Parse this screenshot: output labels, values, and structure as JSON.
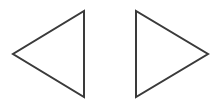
{
  "canvas": {
    "width": 220,
    "height": 105,
    "background_color": "#ffffff",
    "description": "Two outlined triangles side by side on a white background"
  },
  "style": {
    "stroke_color": "#3a3a3a",
    "stroke_width": 2,
    "fill": "none"
  },
  "shapes": [
    {
      "name": "left-pointing-triangle",
      "label": "Left-pointing triangle",
      "direction": "left",
      "points": "84,11 84,97 13,54",
      "vertices": [
        {
          "x": 84,
          "y": 11
        },
        {
          "x": 84,
          "y": 97
        },
        {
          "x": 13,
          "y": 54
        }
      ],
      "apex": {
        "x": 13,
        "y": 54
      },
      "stroke_color": "#3a3a3a",
      "stroke_width": 2
    },
    {
      "name": "right-pointing-triangle",
      "label": "Right-pointing triangle",
      "direction": "right",
      "points": "136,11 136,97 208,54",
      "vertices": [
        {
          "x": 136,
          "y": 11
        },
        {
          "x": 136,
          "y": 97
        },
        {
          "x": 208,
          "y": 54
        }
      ],
      "apex": {
        "x": 208,
        "y": 54
      },
      "stroke_color": "#3a3a3a",
      "stroke_width": 2
    }
  ]
}
